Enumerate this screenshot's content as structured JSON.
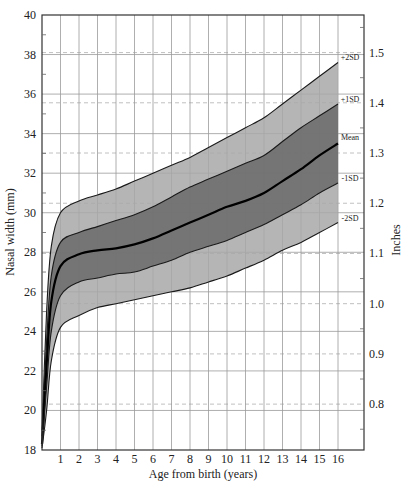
{
  "chart_data": {
    "type": "area",
    "title": "",
    "xlabel": "Age from birth (years)",
    "ylabel": "Nasal width (mm)",
    "ylabel_right": "Inches",
    "xlim": [
      0,
      17.4
    ],
    "ylim": [
      18,
      40
    ],
    "x_ticks": [
      1,
      2,
      3,
      4,
      5,
      6,
      7,
      8,
      9,
      10,
      11,
      12,
      13,
      14,
      15,
      16
    ],
    "y_ticks": [
      18,
      20,
      22,
      24,
      26,
      28,
      30,
      32,
      34,
      36,
      38,
      40
    ],
    "y_right_ticks": [
      "0.8",
      "0.9",
      "1.0",
      "1.1",
      "1.2",
      "1.3",
      "1.4",
      "1.5"
    ],
    "y_right_tick_mm": [
      20.32,
      22.86,
      25.4,
      27.94,
      30.48,
      33.02,
      35.56,
      38.1
    ],
    "grid": true,
    "legend_position": "inline-right",
    "x": [
      0,
      0.25,
      0.5,
      1,
      2,
      3,
      4,
      5,
      6,
      7,
      8,
      9,
      10,
      11,
      12,
      13,
      14,
      15,
      16
    ],
    "series": [
      {
        "name": "+2SD",
        "values": [
          19.0,
          25.0,
          28.3,
          30.0,
          30.6,
          30.9,
          31.2,
          31.6,
          32.0,
          32.4,
          32.8,
          33.3,
          33.8,
          34.3,
          34.8,
          35.5,
          36.2,
          36.9,
          37.6
        ]
      },
      {
        "name": "+1SD",
        "values": [
          18.7,
          23.5,
          26.8,
          28.5,
          29.0,
          29.3,
          29.6,
          29.9,
          30.3,
          30.8,
          31.3,
          31.7,
          32.1,
          32.5,
          32.9,
          33.6,
          34.3,
          34.9,
          35.5
        ]
      },
      {
        "name": "Mean",
        "values": [
          18.3,
          22.3,
          25.5,
          27.3,
          27.9,
          28.1,
          28.2,
          28.4,
          28.7,
          29.1,
          29.5,
          29.9,
          30.3,
          30.6,
          31.0,
          31.6,
          32.2,
          32.9,
          33.5
        ]
      },
      {
        "name": "-1SD",
        "values": [
          18.2,
          21.2,
          24.0,
          25.8,
          26.5,
          26.7,
          26.9,
          27.0,
          27.3,
          27.6,
          28.0,
          28.3,
          28.6,
          29.0,
          29.4,
          29.9,
          30.4,
          31.0,
          31.5
        ]
      },
      {
        "name": "-2SD",
        "values": [
          18.1,
          20.0,
          22.5,
          24.2,
          24.8,
          25.2,
          25.4,
          25.6,
          25.8,
          26.0,
          26.2,
          26.5,
          26.8,
          27.2,
          27.6,
          28.1,
          28.5,
          29.0,
          29.5
        ]
      }
    ],
    "band_colors": {
      "outer": "#a8a8a8",
      "inner": "#6e6e6e",
      "line": "#1a1a1a",
      "mean_line": "#000000",
      "grid": "#9a9a9a",
      "inch_grid": "#b0b0b0"
    },
    "series_labels": [
      "+2SD",
      "+1SD",
      "Mean",
      "-1SD",
      "-2SD"
    ]
  }
}
